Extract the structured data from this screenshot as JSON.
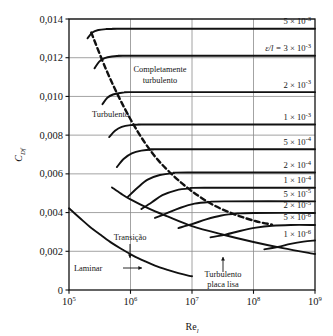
{
  "figure": {
    "title": "",
    "y_axis_label": "C",
    "y_axis_label_sub": "Df",
    "x_axis_label": "Re",
    "x_axis_label_sub": "l"
  },
  "axis": {
    "y_ticks": [
      "0",
      "0,002",
      "0,004",
      "0,006",
      "0,008",
      "0,010",
      "0,012",
      "0,014"
    ],
    "x_ticks": [
      "10",
      "10",
      "10",
      "10",
      "10"
    ],
    "x_tick_exponents": [
      "5",
      "6",
      "7",
      "8",
      "9"
    ]
  },
  "annotations": {
    "completely_turbulent_line1": "Completamente",
    "completely_turbulent_line2": "turbulento",
    "turbulent": "Turbulento",
    "transition": "Transição",
    "laminar": "Laminar",
    "smooth_plate_line1": "Turbulento",
    "smooth_plate_line2": "placa lisa"
  },
  "roughness_labels": [
    {
      "prefix": "",
      "mantissa": "5",
      "exponent": "-3"
    },
    {
      "prefix": "ε/l = ",
      "mantissa": "3",
      "exponent": "-3"
    },
    {
      "prefix": "",
      "mantissa": "2",
      "exponent": "-3"
    },
    {
      "prefix": "",
      "mantissa": "1",
      "exponent": "-3"
    },
    {
      "prefix": "",
      "mantissa": "5",
      "exponent": "-4"
    },
    {
      "prefix": "",
      "mantissa": "2",
      "exponent": "-4"
    },
    {
      "prefix": "",
      "mantissa": "1",
      "exponent": "-4"
    },
    {
      "prefix": "",
      "mantissa": "5",
      "exponent": "-5"
    },
    {
      "prefix": "",
      "mantissa": "2",
      "exponent": "-5"
    },
    {
      "prefix": "",
      "mantissa": "5",
      "exponent": "-6"
    },
    {
      "prefix": "",
      "mantissa": "1",
      "exponent": "-6"
    }
  ],
  "colors": {
    "curve": "#111111",
    "grid": "#8c8c8c",
    "frame": "#111111",
    "background": "#ffffff"
  },
  "chart_data": {
    "type": "line",
    "xlabel": "Re_l",
    "ylabel": "C_Df",
    "xscale": "log",
    "yscale": "linear",
    "xlim": [
      100000,
      1000000000
    ],
    "ylim": [
      0,
      0.014
    ],
    "xticks": [
      100000,
      1000000,
      10000000,
      100000000,
      1000000000
    ],
    "yticks": [
      0,
      0.002,
      0.004,
      0.006,
      0.008,
      0.01,
      0.012,
      0.014
    ],
    "grid": true,
    "legend": "right-inline-labels",
    "series": [
      {
        "name": "Laminar",
        "style": "solid",
        "x": [
          100000,
          150000,
          220000,
          330000,
          500000,
          750000,
          1100000,
          1700000,
          2500000,
          4000000,
          6000000,
          9000000,
          10000000
        ],
        "y": [
          0.00422,
          0.00372,
          0.00326,
          0.00284,
          0.00242,
          0.00208,
          0.00178,
          0.00149,
          0.00126,
          0.00104,
          0.00087,
          0.00073,
          0.00071
        ]
      },
      {
        "name": "Turbulento placa lisa",
        "style": "solid",
        "x": [
          500000,
          700000,
          1000000,
          2000000,
          4000000,
          10000000,
          30000000,
          100000000,
          300000000,
          1000000000
        ],
        "y": [
          0.0053,
          0.00498,
          0.00468,
          0.0042,
          0.0038,
          0.0033,
          0.00288,
          0.00248,
          0.00216,
          0.00186
        ]
      },
      {
        "name": "eps/l = 5e-3",
        "label": "5 × 10⁻³",
        "roughness": 0.005,
        "style": "solid",
        "x": [
          200000,
          240000,
          300000,
          400000,
          600000,
          1000000,
          1000000000
        ],
        "y": [
          0.013,
          0.0133,
          0.01343,
          0.01348,
          0.0135,
          0.0135,
          0.0135
        ]
      },
      {
        "name": "eps/l = 3e-3",
        "label": "ε/l = 3 × 10⁻³",
        "roughness": 0.003,
        "style": "solid",
        "x": [
          260000,
          310000,
          380000,
          500000,
          750000,
          1200000,
          1000000000
        ],
        "y": [
          0.01145,
          0.0118,
          0.01198,
          0.01206,
          0.0121,
          0.0121,
          0.0121
        ]
      },
      {
        "name": "eps/l = 2e-3",
        "label": "2 × 10⁻³",
        "roughness": 0.002,
        "style": "solid",
        "x": [
          350000,
          420000,
          520000,
          680000,
          950000,
          1500000,
          1000000000
        ],
        "y": [
          0.0096,
          0.00993,
          0.0101,
          0.01018,
          0.01022,
          0.01022,
          0.01022
        ]
      },
      {
        "name": "eps/l = 1e-3",
        "label": "1 × 10⁻³",
        "roughness": 0.001,
        "style": "solid",
        "x": [
          450000,
          560000,
          720000,
          1000000,
          1500000,
          2400000,
          1000000000
        ],
        "y": [
          0.0079,
          0.00823,
          0.00843,
          0.00852,
          0.00855,
          0.00855,
          0.00855
        ]
      },
      {
        "name": "eps/l = 5e-4",
        "label": "5 × 10⁻⁴",
        "roughness": 0.0005,
        "style": "solid",
        "x": [
          600000,
          780000,
          1050000,
          1500000,
          2300000,
          3800000,
          1000000000
        ],
        "y": [
          0.00635,
          0.00678,
          0.00706,
          0.0072,
          0.00726,
          0.00727,
          0.00727
        ]
      },
      {
        "name": "eps/l = 2e-4",
        "label": "2 × 10⁻⁴",
        "roughness": 0.0002,
        "style": "solid",
        "x": [
          900000,
          1300000,
          1900000,
          3000000,
          5000000,
          8500000,
          1000000000
        ],
        "y": [
          0.0048,
          0.00528,
          0.0057,
          0.00594,
          0.00604,
          0.00607,
          0.00607
        ]
      },
      {
        "name": "eps/l = 1e-4",
        "label": "1 × 10⁻⁴",
        "roughness": 0.0001,
        "style": "solid",
        "x": [
          1500000,
          2200000,
          3300000,
          5500000,
          9000000,
          16000000,
          1000000000
        ],
        "y": [
          0.00418,
          0.00452,
          0.0049,
          0.00515,
          0.00525,
          0.00528,
          0.00528
        ]
      },
      {
        "name": "eps/l = 5e-5",
        "label": "5 × 10⁻⁵",
        "roughness": 5e-05,
        "style": "solid",
        "x": [
          2500000,
          4000000,
          6500000,
          11000000,
          19000000,
          33000000,
          1000000000
        ],
        "y": [
          0.00372,
          0.00398,
          0.00425,
          0.00446,
          0.00455,
          0.00458,
          0.00458
        ]
      },
      {
        "name": "eps/l = 2e-5",
        "label": "2 × 10⁻⁵",
        "roughness": 2e-05,
        "style": "solid",
        "x": [
          6000000,
          10000000,
          17000000,
          30000000,
          55000000,
          100000000,
          1000000000
        ],
        "y": [
          0.0032,
          0.0034,
          0.00365,
          0.00385,
          0.00395,
          0.00398,
          0.00398
        ]
      },
      {
        "name": "eps/l = 5e-6",
        "label": "5 × 10⁻⁶",
        "roughness": 5e-06,
        "style": "solid",
        "x": [
          20000000,
          35000000,
          60000000,
          110000000,
          200000000,
          400000000,
          1000000000
        ],
        "y": [
          0.00272,
          0.00286,
          0.00305,
          0.00322,
          0.00332,
          0.00336,
          0.00336
        ]
      },
      {
        "name": "eps/l = 1e-6",
        "label": "1 × 10⁻⁶",
        "roughness": 1e-06,
        "style": "solid",
        "x": [
          150000000,
          250000000,
          400000000,
          650000000,
          1000000000
        ],
        "y": [
          0.0021,
          0.00222,
          0.00238,
          0.0025,
          0.00256
        ]
      },
      {
        "name": "Limite completamente turbulento",
        "style": "dashed",
        "x": [
          230000,
          400000,
          700000,
          1300000,
          2500000,
          5000000,
          10000000,
          22000000,
          50000000,
          110000000,
          200000000
        ],
        "y": [
          0.0133,
          0.0114,
          0.00975,
          0.0082,
          0.0069,
          0.0059,
          0.0051,
          0.0044,
          0.0039,
          0.00355,
          0.00338
        ]
      }
    ]
  }
}
